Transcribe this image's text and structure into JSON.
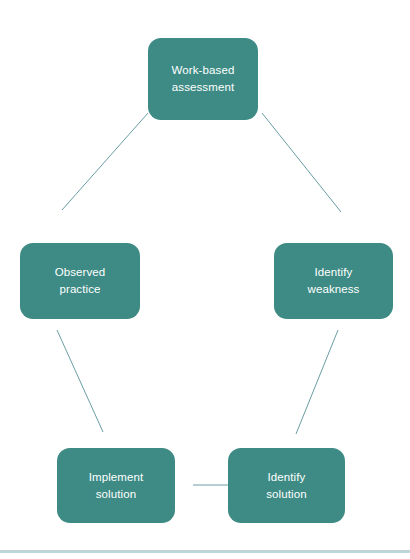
{
  "diagram": {
    "type": "cycle-flow-diagram",
    "background_color": "#ffffff",
    "node_fill_color": "#3d8b84",
    "node_text_color": "#ffffff",
    "connector_color": "#6a9ea3",
    "bottom_rule_color": "#bfd6d8",
    "nodes": [
      {
        "id": "work-based-assessment",
        "label": "Work-based\nassessment",
        "line1": "Work-based",
        "line2": "assessment",
        "x": 148,
        "y": 38,
        "width": 110,
        "height": 82
      },
      {
        "id": "observed-practice",
        "label": "Observed\npractice",
        "line1": "Observed",
        "line2": "practice",
        "x": 20,
        "y": 243,
        "width": 120,
        "height": 76
      },
      {
        "id": "identify-weakness",
        "label": "Identify\nweakness",
        "line1": "Identify",
        "line2": "weakness",
        "x": 274,
        "y": 243,
        "width": 119,
        "height": 76
      },
      {
        "id": "implement-solution",
        "label": "Implement\nsolution",
        "line1": "Implement",
        "line2": "solution",
        "x": 57,
        "y": 448,
        "width": 118,
        "height": 75
      },
      {
        "id": "identify-solution",
        "label": "Identify\nsolution",
        "line1": "Identify",
        "line2": "solution",
        "x": 228,
        "y": 448,
        "width": 117,
        "height": 75
      }
    ],
    "connectors": [
      {
        "id": "assessment-to-observed-practice",
        "from": "work-based-assessment",
        "to": "observed-practice",
        "x1": 148,
        "y1": 113,
        "x2": 62,
        "y2": 210
      },
      {
        "id": "assessment-to-identify-weakness",
        "from": "work-based-assessment",
        "to": "identify-weakness",
        "x1": 262,
        "y1": 113,
        "x2": 341,
        "y2": 212
      },
      {
        "id": "observed-practice-to-implement-solution",
        "from": "observed-practice",
        "to": "implement-solution",
        "x1": 57,
        "y1": 330,
        "x2": 103,
        "y2": 432
      },
      {
        "id": "identify-weakness-to-identify-solution",
        "from": "identify-weakness",
        "to": "identify-solution",
        "x1": 338,
        "y1": 330,
        "x2": 296,
        "y2": 434
      },
      {
        "id": "identify-solution-to-implement-solution",
        "from": "identify-solution",
        "to": "implement-solution",
        "x1": 193,
        "y1": 485,
        "x2": 229,
        "y2": 485
      }
    ],
    "bottom_rule": {
      "y": 550,
      "height": 3
    }
  }
}
